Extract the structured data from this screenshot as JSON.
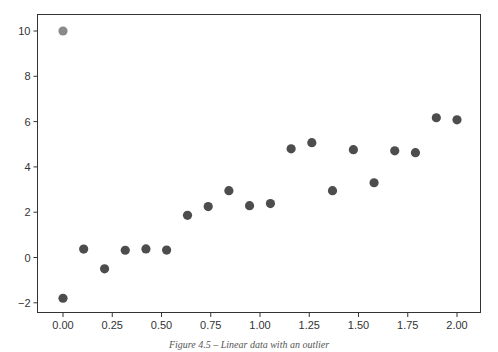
{
  "chart_data": {
    "type": "scatter",
    "title": "",
    "xlabel": "",
    "ylabel": "",
    "xlim": [
      -0.1,
      2.1
    ],
    "ylim": [
      -2.4,
      10.8
    ],
    "grid": false,
    "legend": null,
    "x_ticks": [
      "0.00",
      "0.25",
      "0.50",
      "0.75",
      "1.00",
      "1.25",
      "1.50",
      "1.75",
      "2.00"
    ],
    "y_ticks": [
      "−2",
      "0",
      "2",
      "4",
      "6",
      "8",
      "10"
    ],
    "series": [
      {
        "name": "data",
        "color": "#4d4d4d",
        "x": [
          0.0,
          0.105,
          0.211,
          0.316,
          0.421,
          0.526,
          0.632,
          0.737,
          0.842,
          0.947,
          1.053,
          1.158,
          1.263,
          1.368,
          1.474,
          1.579,
          1.684,
          1.789,
          1.895,
          2.0
        ],
        "y": [
          -1.8,
          0.37,
          -0.5,
          0.32,
          0.38,
          0.33,
          1.86,
          2.25,
          2.95,
          2.29,
          2.38,
          4.8,
          5.07,
          2.95,
          4.76,
          3.3,
          4.71,
          4.63,
          6.17,
          6.08
        ]
      },
      {
        "name": "outlier",
        "color": "#8a8a8a",
        "x": [
          0.0
        ],
        "y": [
          10.0
        ]
      }
    ]
  },
  "caption": "Figure 4.5 – Linear data with an outlier"
}
